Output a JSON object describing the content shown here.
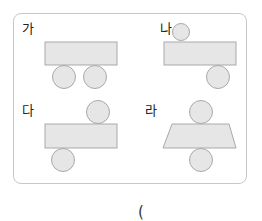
{
  "figure": {
    "options": [
      {
        "label": "가",
        "description": "rectangle with two circles below"
      },
      {
        "label": "나",
        "description": "small circle above left, rectangle, circle below right"
      },
      {
        "label": "다",
        "description": "circle above right, rectangle, circle below left"
      },
      {
        "label": "라",
        "description": "circle above, trapezoid, circle below"
      }
    ],
    "colors": {
      "fill": "#e6e6e6",
      "stroke": "#a9a9a9",
      "border": "#c8c8c8"
    }
  },
  "answer": {
    "open_paren": "("
  }
}
